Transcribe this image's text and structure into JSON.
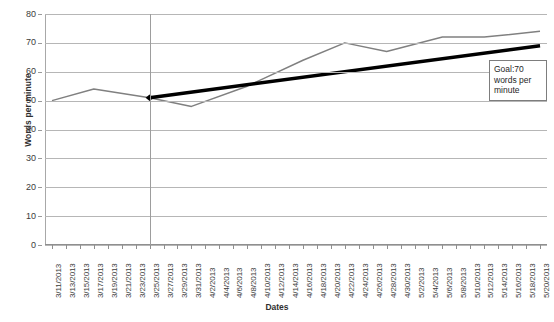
{
  "chart_data": {
    "type": "line",
    "title": "",
    "xlabel": "Dates",
    "ylabel": "Words per minute",
    "ylim": [
      0,
      80
    ],
    "ytick_step": 10,
    "yticks": [
      0,
      10,
      20,
      30,
      40,
      50,
      60,
      70,
      80
    ],
    "grid": true,
    "legend_position": "none",
    "categories": [
      "3/11/2013",
      "3/13/2013",
      "3/15/2013",
      "3/17/2013",
      "3/19/2013",
      "3/21/2013",
      "3/23/2013",
      "3/25/2013",
      "3/27/2013",
      "3/29/2013",
      "3/31/2013",
      "4/2/2013",
      "4/4/2013",
      "4/6/2013",
      "4/8/2013",
      "4/10/2013",
      "4/12/2013",
      "4/14/2013",
      "4/16/2013",
      "4/18/2013",
      "4/20/2013",
      "4/22/2013",
      "4/24/2013",
      "4/26/2013",
      "4/28/2013",
      "4/30/2013",
      "5/2/2013",
      "5/4/2013",
      "5/6/2013",
      "5/8/2013",
      "5/10/2013",
      "5/12/2013",
      "5/14/2013",
      "5/16/2013",
      "5/18/2013",
      "5/20/2013"
    ],
    "series": [
      {
        "name": "Words per minute",
        "color": "#808080",
        "style": "line",
        "points": [
          {
            "x": "3/11/2013",
            "y": 50
          },
          {
            "x": "3/17/2013",
            "y": 54
          },
          {
            "x": "3/25/2013",
            "y": 51
          },
          {
            "x": "3/31/2013",
            "y": 48
          },
          {
            "x": "4/8/2013",
            "y": 55
          },
          {
            "x": "4/16/2013",
            "y": 64
          },
          {
            "x": "4/22/2013",
            "y": 70
          },
          {
            "x": "4/28/2013",
            "y": 67
          },
          {
            "x": "5/6/2013",
            "y": 72
          },
          {
            "x": "5/12/2013",
            "y": 72
          },
          {
            "x": "5/20/2013",
            "y": 74
          }
        ]
      },
      {
        "name": "Goal line",
        "color": "#000000",
        "style": "trend",
        "points": [
          {
            "x": "3/25/2013",
            "y": 51
          },
          {
            "x": "5/20/2013",
            "y": 69
          }
        ],
        "marker": {
          "x": "3/25/2013",
          "y": 51,
          "shape": "diamond"
        }
      }
    ],
    "vertical_reference_line": {
      "x": "3/25/2013",
      "color": "#9d9d9d"
    },
    "annotation": {
      "text": "Goal:70 words per minute",
      "lines": [
        "Goal:70",
        "words per",
        "minute"
      ]
    }
  }
}
